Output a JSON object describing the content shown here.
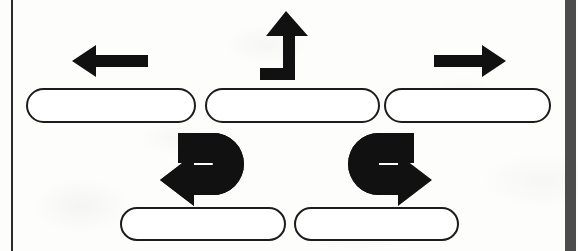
{
  "page": {
    "width": 578,
    "height": 251,
    "background_color": "#fdfdfc",
    "ink_color": "#1c1c1c",
    "media": "scanned-worksheet-diagram"
  },
  "rules": {
    "left_rule": {
      "name": "left-margin-rule",
      "color": "#2b2b2b",
      "x": 11,
      "width": 2
    },
    "right_bar": {
      "name": "right-edge-bar",
      "color": "#4c4c4c",
      "x": 565,
      "width": 11
    }
  },
  "rows": [
    {
      "row_name": "top-row",
      "cells": [
        {
          "icon_name": "arrow-left-icon",
          "icon_label": "left arrow",
          "meaning": "turn left",
          "answer_box_label": "",
          "answer_box_placeholder": ""
        },
        {
          "icon_name": "arrow-up-turn-icon",
          "icon_label": "L-shaped arrow turning upward",
          "meaning": "go straight ahead",
          "answer_box_label": "",
          "answer_box_placeholder": ""
        },
        {
          "icon_name": "arrow-right-icon",
          "icon_label": "right arrow",
          "meaning": "turn right",
          "answer_box_label": "",
          "answer_box_placeholder": ""
        }
      ]
    },
    {
      "row_name": "bottom-row",
      "cells": [
        {
          "icon_name": "u-turn-left-icon",
          "icon_label": "U-turn arrow pointing left",
          "meaning": "make a U-turn to the left",
          "answer_box_label": "",
          "answer_box_placeholder": ""
        },
        {
          "icon_name": "u-turn-right-icon",
          "icon_label": "U-turn arrow pointing right",
          "meaning": "make a U-turn to the right",
          "answer_box_label": "",
          "answer_box_placeholder": ""
        }
      ]
    }
  ]
}
